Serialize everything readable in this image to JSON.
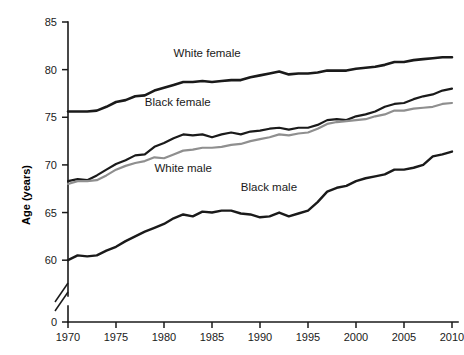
{
  "chart_data": {
    "type": "line",
    "title": "",
    "xlabel": "",
    "ylabel": "Age (years)",
    "xlim": [
      1970,
      2010
    ],
    "ylim": [
      57.5,
      85
    ],
    "y_axis_break": true,
    "y_break_from": 0,
    "y_break_to": 57.5,
    "grid": false,
    "legend": "inline-annotations",
    "x_ticks": [
      "1970",
      "1975",
      "1980",
      "1985",
      "1990",
      "1995",
      "2000",
      "2005",
      "2010"
    ],
    "y_ticks": [
      "0",
      "60",
      "65",
      "70",
      "75",
      "80",
      "85"
    ],
    "x": [
      1970,
      1971,
      1972,
      1973,
      1974,
      1975,
      1976,
      1977,
      1978,
      1979,
      1980,
      1981,
      1982,
      1983,
      1984,
      1985,
      1986,
      1987,
      1988,
      1989,
      1990,
      1991,
      1992,
      1993,
      1994,
      1995,
      1996,
      1997,
      1998,
      1999,
      2000,
      2001,
      2002,
      2003,
      2004,
      2005,
      2006,
      2007,
      2008,
      2009,
      2010
    ],
    "series": [
      {
        "name": "White female",
        "color": "#1a1a1a",
        "width": 2.6,
        "label_x": 1981.0,
        "label_y": 81.3,
        "values": [
          75.6,
          75.6,
          75.6,
          75.7,
          76.1,
          76.6,
          76.8,
          77.2,
          77.3,
          77.8,
          78.1,
          78.4,
          78.7,
          78.7,
          78.8,
          78.7,
          78.8,
          78.9,
          78.9,
          79.2,
          79.4,
          79.6,
          79.8,
          79.5,
          79.6,
          79.6,
          79.7,
          79.9,
          79.9,
          79.9,
          80.1,
          80.2,
          80.3,
          80.5,
          80.8,
          80.8,
          81.0,
          81.1,
          81.2,
          81.3,
          81.3
        ]
      },
      {
        "name": "Black female",
        "color": "#1a1a1a",
        "width": 2.2,
        "label_x": 1978.0,
        "label_y": 76.2,
        "values": [
          68.3,
          68.5,
          68.4,
          68.9,
          69.5,
          70.1,
          70.5,
          71.0,
          71.1,
          71.9,
          72.3,
          72.8,
          73.2,
          73.1,
          73.2,
          72.9,
          73.2,
          73.4,
          73.2,
          73.5,
          73.6,
          73.8,
          73.9,
          73.7,
          73.9,
          73.9,
          74.2,
          74.7,
          74.8,
          74.7,
          75.1,
          75.3,
          75.6,
          76.1,
          76.4,
          76.5,
          76.9,
          77.2,
          77.4,
          77.8,
          78.0
        ]
      },
      {
        "name": "White male",
        "color": "#8f8f8f",
        "width": 2.2,
        "label_x": 1979.0,
        "label_y": 69.3,
        "values": [
          68.0,
          68.3,
          68.3,
          68.4,
          68.9,
          69.5,
          69.9,
          70.2,
          70.4,
          70.8,
          70.7,
          71.1,
          71.5,
          71.6,
          71.8,
          71.8,
          71.9,
          72.1,
          72.2,
          72.5,
          72.7,
          72.9,
          73.2,
          73.1,
          73.3,
          73.4,
          73.8,
          74.3,
          74.5,
          74.6,
          74.7,
          74.8,
          75.1,
          75.3,
          75.7,
          75.7,
          75.9,
          76.0,
          76.1,
          76.4,
          76.5
        ]
      },
      {
        "name": "Black male",
        "color": "#1a1a1a",
        "width": 2.4,
        "label_x": 1988.0,
        "label_y": 67.3,
        "values": [
          60.0,
          60.5,
          60.4,
          60.5,
          61.0,
          61.4,
          62.0,
          62.5,
          63.0,
          63.4,
          63.8,
          64.4,
          64.8,
          64.6,
          65.1,
          65.0,
          65.2,
          65.2,
          64.9,
          64.8,
          64.5,
          64.6,
          65.0,
          64.6,
          64.9,
          65.2,
          66.1,
          67.2,
          67.6,
          67.8,
          68.3,
          68.6,
          68.8,
          69.0,
          69.5,
          69.5,
          69.7,
          70.0,
          70.9,
          71.1,
          71.4
        ]
      }
    ]
  }
}
